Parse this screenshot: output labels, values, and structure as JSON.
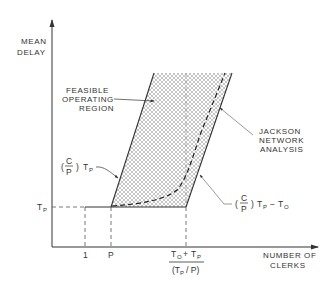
{
  "axes": {
    "y_label_line1": "MEAN",
    "y_label_line2": "DELAY",
    "x_label_line1": "NUMBER OF",
    "x_label_line2": "CLERKS"
  },
  "x_ticks": {
    "one": "1",
    "p": "P",
    "third_numerator_a": "T",
    "third_numerator_a_sub": "O",
    "third_numerator_plus": "+",
    "third_numerator_b": "T",
    "third_numerator_b_sub": "P",
    "third_denominator_open": "(T",
    "third_denominator_sub": "P",
    "third_denominator_close": "/ P)"
  },
  "y_ticks": {
    "tp": "T",
    "tp_sub": "P"
  },
  "annotations": {
    "feasible_line1": "FEASIBLE",
    "feasible_line2": "OPERATING",
    "feasible_line3": "REGION",
    "jackson_line1": "JACKSON",
    "jackson_line2": "NETWORK",
    "jackson_line3": "ANALYSIS",
    "left_bound_open": "(",
    "left_bound_c": "C",
    "left_bound_p": "P",
    "left_bound_close": ")",
    "left_bound_t": "T",
    "left_bound_t_sub": "P",
    "right_bound_open": "(",
    "right_bound_c": "C",
    "right_bound_p": "P",
    "right_bound_close": ")",
    "right_bound_t": "T",
    "right_bound_t_sub": "P",
    "right_bound_minus": "−",
    "right_bound_t2": "T",
    "right_bound_t2_sub": "O"
  },
  "colors": {
    "ink": "#333333",
    "hatch": "#9a9a9a"
  }
}
